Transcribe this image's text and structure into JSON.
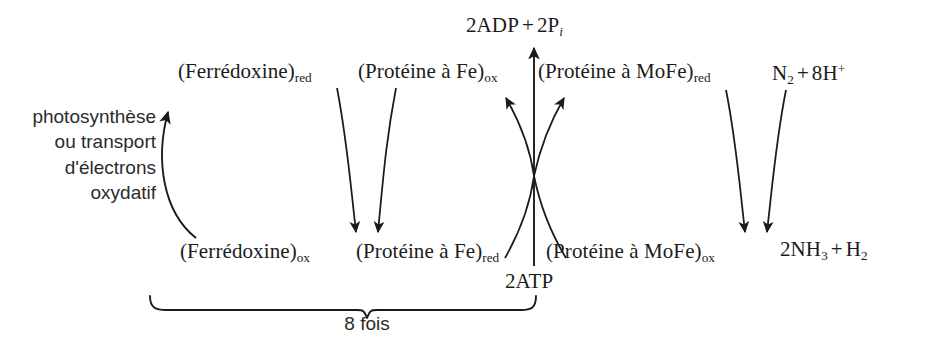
{
  "diagram": {
    "background_color": "#ffffff",
    "stroke_color": "#1b1b1b",
    "text_color": "#1b1b1b",
    "annotation_color": "#2b2b2b"
  },
  "annotations": {
    "electron_source": "photosynthèse ou transport d'électrons oxydatif",
    "electron_source_lines": [
      "photosynthèse",
      "ou transport",
      "d'électrons",
      "oxydatif"
    ],
    "cycle_count": "8 fois"
  },
  "species": {
    "ferredoxin_red": {
      "name": "(Ferrédoxine)",
      "state": "red"
    },
    "ferredoxin_ox": {
      "name": "(Ferrédoxine)",
      "state": "ox"
    },
    "fe_protein_ox": {
      "name": "(Protéine à Fe)",
      "state": "ox"
    },
    "fe_protein_red": {
      "name": "(Protéine à Fe)",
      "state": "red"
    },
    "mofe_protein_red": {
      "name": "(Protéine à MoFe)",
      "state": "red"
    },
    "mofe_protein_ox": {
      "name": "(Protéine à MoFe)",
      "state": "ox"
    }
  },
  "energetics": {
    "atp": "2ATP",
    "adp": "2ADP",
    "plus": "+",
    "phosphate_number": "2P",
    "phosphate_subscript": "i"
  },
  "reaction": {
    "substrate": {
      "dinitrogen": "N",
      "dinitrogen_subscript": "2",
      "plus": "+",
      "protons_number": "8H",
      "protons_superscript": "+"
    },
    "product": {
      "ammonia_number": "2NH",
      "ammonia_subscript": "3",
      "plus": "+",
      "dihydrogen": "H",
      "dihydrogen_subscript": "2"
    }
  }
}
